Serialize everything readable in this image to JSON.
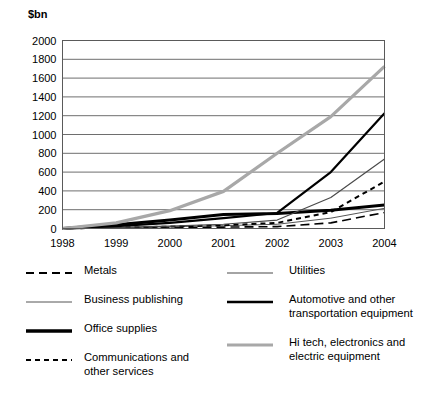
{
  "chart_data": {
    "type": "line",
    "title": "",
    "subtitle": "",
    "xlabel": "",
    "ylabel": "$bn",
    "unit_label": "$bn",
    "grid": true,
    "legend_position": "below",
    "x": [
      1998,
      1999,
      2000,
      2001,
      2002,
      2003,
      2004
    ],
    "xtick_labels": [
      "1998",
      "1999",
      "2000",
      "2001",
      "2002",
      "2003",
      "2004"
    ],
    "xlim": [
      1998,
      2004
    ],
    "ylim": [
      0,
      2000
    ],
    "ytick_labels": [
      "2000",
      "1800",
      "1600",
      "1400",
      "1200",
      "1000",
      "800",
      "600",
      "400",
      "200",
      "0"
    ],
    "ytick_values": [
      2000,
      1800,
      1600,
      1400,
      1200,
      1000,
      800,
      600,
      400,
      200,
      0
    ],
    "series": [
      {
        "name": "Metals",
        "style": "dashed-long",
        "color": "#000000",
        "width": 1.6,
        "values": [
          0,
          5,
          10,
          15,
          20,
          60,
          170
        ]
      },
      {
        "name": "Business publishing",
        "style": "solid-thin",
        "color": "#555555",
        "width": 1.0,
        "values": [
          0,
          8,
          18,
          30,
          45,
          110,
          215
        ]
      },
      {
        "name": "Office supplies",
        "style": "solid-thick",
        "color": "#000000",
        "width": 3.0,
        "values": [
          0,
          40,
          90,
          150,
          160,
          195,
          250
        ]
      },
      {
        "name": "Communications and other services",
        "style": "dashed-short",
        "color": "#000000",
        "width": 2.0,
        "values": [
          0,
          10,
          20,
          35,
          60,
          175,
          500
        ]
      },
      {
        "name": "Utilities",
        "style": "solid-thin",
        "color": "#4a4a4a",
        "width": 1.2,
        "values": [
          0,
          12,
          25,
          45,
          90,
          330,
          740
        ]
      },
      {
        "name": "Automotive and other transportation equipment",
        "style": "solid-medium",
        "color": "#000000",
        "width": 2.2,
        "values": [
          0,
          25,
          60,
          110,
          165,
          600,
          1225
        ]
      },
      {
        "name": "Hi tech, electronics and electric equipment",
        "style": "solid-thick-gray",
        "color": "#a8a8a8",
        "width": 3.2,
        "values": [
          0,
          60,
          190,
          395,
          800,
          1190,
          1725
        ]
      }
    ]
  },
  "legend": {
    "left_column": [
      {
        "label": "Metals",
        "swatch": "dashed-long-swatch"
      },
      {
        "label": "Business publishing",
        "swatch": "solid-thin-swatch"
      },
      {
        "label": "Office supplies",
        "swatch": "solid-thick-swatch"
      },
      {
        "label": "Communications and\nother services",
        "swatch": "dashed-short-swatch"
      }
    ],
    "right_column": [
      {
        "label": "Utilities",
        "swatch": "solid-thin-gray-swatch"
      },
      {
        "label": "Automotive and other\ntransportation equipment",
        "swatch": "solid-medium-swatch"
      },
      {
        "label": "Hi tech, electronics and\nelectric equipment",
        "swatch": "solid-thick-gray-swatch"
      }
    ]
  },
  "colors": {
    "background": "#ffffff",
    "axis": "#5a5a5a",
    "gridline": "#6e6e6e",
    "text": "#000000",
    "gray_series": "#a8a8a8",
    "mid_gray_series": "#4a4a4a"
  }
}
